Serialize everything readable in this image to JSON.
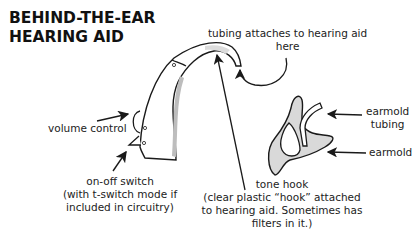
{
  "title": {
    "line1": "BEHIND-THE-EAR",
    "line2": "HEARING AID"
  },
  "labels": {
    "tubing_attaches_1": "tubing attaches to hearing aid",
    "tubing_attaches_2": "here",
    "volume_control": "volume control",
    "on_off_1": "on-off switch",
    "on_off_2": "(with t-switch mode if",
    "on_off_3": "included in circuitry)",
    "tone_hook_1": "tone hook",
    "tone_hook_2": "(clear plastic “hook” attached",
    "tone_hook_3": "to hearing aid. Sometimes has",
    "tone_hook_4": "filters in it.)",
    "earmold_tubing_1": "earmold",
    "earmold_tubing_2": "tubing",
    "earmold": "earmold"
  },
  "colors": {
    "ink": "#1a1a1a",
    "shade": "#c8c8c8",
    "fill": "#e6e6e6"
  }
}
